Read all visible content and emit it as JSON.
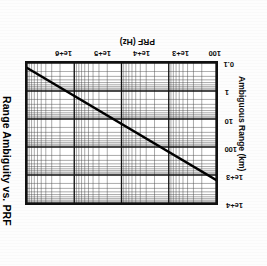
{
  "figure": {
    "title": "Range Ambiguity vs. PRF",
    "orientation_deg": 180,
    "background": "#ffffff",
    "line_color": "#000000",
    "grid_color": "#3a3a3a",
    "frame_color": "#111111"
  },
  "axes": {
    "x": {
      "label": "PRF (Hz)",
      "scale": "log",
      "min": 100,
      "max": 1000000,
      "ticks": [
        {
          "value": 100,
          "label": "100"
        },
        {
          "value": 1000,
          "label": "1e+3"
        },
        {
          "value": 10000,
          "label": "1e+4"
        },
        {
          "value": 100000,
          "label": "1e+5"
        },
        {
          "value": 1000000,
          "label": "1e+6"
        }
      ]
    },
    "y": {
      "label": "Ambiguous Range (km)",
      "scale": "log",
      "min": 0.1,
      "max": 10000,
      "ticks": [
        {
          "value": 0.1,
          "label": "0.1"
        },
        {
          "value": 1,
          "label": "1"
        },
        {
          "value": 10,
          "label": "10"
        },
        {
          "value": 100,
          "label": "100"
        },
        {
          "value": 1000,
          "label": "1e+3"
        },
        {
          "value": 10000,
          "label": "1e+4"
        }
      ]
    }
  },
  "chart_data": {
    "type": "line",
    "title": "Range Ambiguity vs. PRF",
    "xlabel": "PRF (Hz)",
    "ylabel": "Ambiguous Range (km)",
    "xscale": "log",
    "yscale": "log",
    "xlim": [
      100,
      1000000
    ],
    "ylim": [
      0.1,
      10000
    ],
    "grid": true,
    "legend": null,
    "series": [
      {
        "name": "Ambiguous Range",
        "x": [
          100,
          1000,
          10000,
          100000,
          1000000
        ],
        "values": [
          1500,
          150,
          15,
          1.5,
          0.15
        ]
      }
    ]
  }
}
